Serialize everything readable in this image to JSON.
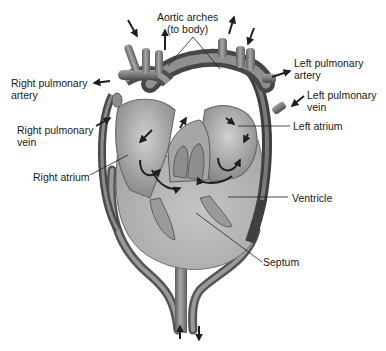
{
  "figure": {
    "colors": {
      "vessel_dark": "#5a5a5a",
      "vessel_mid": "#8a8a8a",
      "vessel_light": "#b5b5b5",
      "ventricle_fill": "#b8b8b8",
      "chamber_fill": "#9e9e9e",
      "arrow": "#1f1f1f",
      "leader_line": "#222222",
      "background": "#ffffff"
    }
  },
  "labels": {
    "aortic_arches": "Aortic arches\n(to body)",
    "right_pulmonary_artery": "Right pulmonary\nartery",
    "right_pulmonary_vein": "Right pulmonary\nvein",
    "right_atrium": "Right atrium",
    "left_pulmonary_artery": "Left pulmonary\nartery",
    "left_pulmonary_vein": "Left pulmonary\nvein",
    "left_atrium": "Left atrium",
    "ventricle": "Ventricle",
    "septum": "Septum"
  }
}
